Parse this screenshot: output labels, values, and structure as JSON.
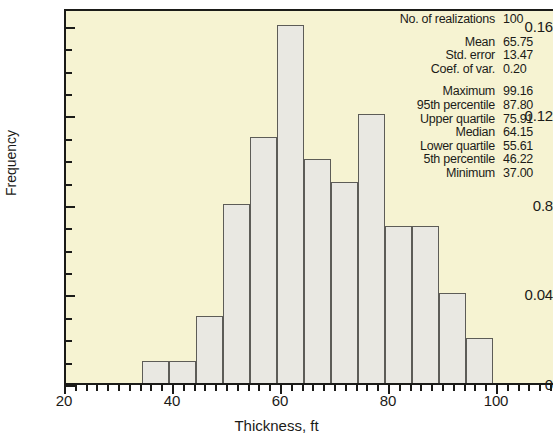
{
  "chart_data": {
    "type": "bar",
    "title": "",
    "xlabel": "Thickness, ft",
    "ylabel": "Frequency",
    "xlim": [
      20,
      110
    ],
    "ylim": [
      0,
      0.168
    ],
    "xticks": [
      20,
      40,
      60,
      80,
      100
    ],
    "ytick_labels": [
      "0.16",
      "0.12",
      "0.8",
      "0.04",
      "0"
    ],
    "ytick_values": [
      0.16,
      0.12,
      0.08,
      0.04,
      0
    ],
    "grid": false,
    "legend": "none",
    "bin_width": 5,
    "bin_starts": [
      34,
      39,
      44,
      49,
      54,
      59,
      64,
      69,
      74,
      79,
      84,
      89,
      94
    ],
    "categories": [
      "34-39",
      "39-44",
      "44-49",
      "49-54",
      "54-59",
      "59-64",
      "64-69",
      "69-74",
      "74-79",
      "79-84",
      "84-89",
      "89-94",
      "94-99"
    ],
    "values": [
      0.01,
      0.01,
      0.03,
      0.08,
      0.11,
      0.16,
      0.1,
      0.09,
      0.12,
      0.07,
      0.07,
      0.04,
      0.02
    ],
    "bar_fill": "#e9e8e2",
    "bar_stroke": "#5d5c57",
    "plot_background": "#f6f3d2"
  },
  "axes": {
    "y_title": "Frequency",
    "x_title": "Thickness, ft",
    "y_tick_labels": [
      "0.16",
      "0.12",
      "0.8",
      "0.04",
      "0"
    ],
    "x_tick_labels": [
      "20",
      "40",
      "60",
      "80",
      "100"
    ]
  },
  "stats": {
    "rows": [
      {
        "label": "No. of realizations",
        "value": "100",
        "gap_after": true
      },
      {
        "label": "Mean",
        "value": "65.75",
        "gap_after": false
      },
      {
        "label": "Std. error",
        "value": "13.47",
        "gap_after": false
      },
      {
        "label": "Coef. of var.",
        "value": "0.20",
        "gap_after": true
      },
      {
        "label": "Maximum",
        "value": "99.16",
        "gap_after": false
      },
      {
        "label": "95th percentile",
        "value": "87.80",
        "gap_after": false
      },
      {
        "label": "Upper quartile",
        "value": "75.91",
        "gap_after": false
      },
      {
        "label": "Median",
        "value": "64.15",
        "gap_after": false
      },
      {
        "label": "Lower quartile",
        "value": "55.61",
        "gap_after": false
      },
      {
        "label": "5th percentile",
        "value": "46.22",
        "gap_after": false
      },
      {
        "label": "Minimum",
        "value": "37.00",
        "gap_after": false
      }
    ]
  }
}
